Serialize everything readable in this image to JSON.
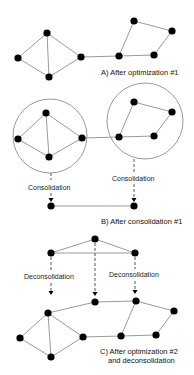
{
  "diagram": {
    "colors": {
      "node": "#000000",
      "edge": "#9a9a9a",
      "dashed": "#555555",
      "text": "#222222"
    },
    "panels": [
      {
        "id": "A",
        "caption": [
          "A) After optimization #1"
        ],
        "nodes": [
          "a1",
          "a2",
          "a3",
          "a4",
          "a5",
          "a6",
          "a7",
          "a8"
        ],
        "edges": [
          [
            "a1",
            "a2"
          ],
          [
            "a1",
            "a3"
          ],
          [
            "a1",
            "a4"
          ],
          [
            "a2",
            "a4"
          ],
          [
            "a3",
            "a4"
          ],
          [
            "a3",
            "a7"
          ],
          [
            "a7",
            "a5"
          ],
          [
            "a5",
            "a6"
          ],
          [
            "a6",
            "a8"
          ],
          [
            "a7",
            "a8"
          ]
        ]
      },
      {
        "id": "B",
        "caption": [
          "B) After consolidation #1"
        ],
        "clusters": [
          "left-cluster",
          "right-cluster"
        ],
        "arrow_labels": [
          "Consolidation",
          "Consolidation"
        ],
        "consolidated_nodes": [
          "c1",
          "c2"
        ],
        "consolidated_edges": [
          [
            "c1",
            "c2"
          ]
        ]
      },
      {
        "id": "C",
        "caption": [
          "C) After optimization #2",
          "and deconsolidation"
        ],
        "top_nodes": [
          "d1",
          "d2",
          "d3"
        ],
        "top_edges": [
          [
            "d1",
            "d2"
          ],
          [
            "d1",
            "d3"
          ],
          [
            "d2",
            "d3"
          ]
        ],
        "arrow_labels": [
          "Deconsolidation",
          "Deconsolidation"
        ]
      }
    ]
  },
  "labels": {
    "caption_a": "A) After optimization #1",
    "consolidation_left": "Consolidation",
    "consolidation_right": "Consolidation",
    "caption_b": "B) After consolidation #1",
    "deconsolidation_left": "Deconsolidation",
    "deconsolidation_right": "Deconsolidation",
    "caption_c1": "C) After optimization #2",
    "caption_c2": "and deconsolidation"
  }
}
